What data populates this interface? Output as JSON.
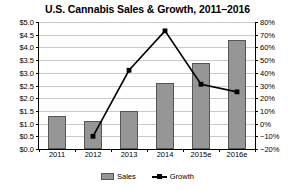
{
  "chart_data": {
    "type": "bar",
    "title": "U.S. Cannabis Sales & Growth, 2011–2016",
    "xlabel": "",
    "ylabel": "",
    "categories": [
      "2011",
      "2012",
      "2013",
      "2014",
      "2015e",
      "2016e"
    ],
    "grid": true,
    "legend_position": "bottom",
    "series": [
      {
        "name": "Sales",
        "type": "bar",
        "axis": "left",
        "unit": "billion USD",
        "values": [
          1.3,
          1.1,
          1.5,
          2.6,
          3.4,
          4.3
        ],
        "color": "#969696"
      },
      {
        "name": "Growth",
        "type": "line",
        "axis": "right",
        "unit": "percent",
        "values": [
          null,
          -10,
          42,
          73,
          31,
          25
        ],
        "color": "#000000"
      }
    ],
    "left_axis": {
      "min": 0.0,
      "max": 5.0,
      "step": 0.5,
      "ticks": [
        "$0.0",
        "$0.5",
        "$1.0",
        "$1.5",
        "$2.0",
        "$2.5",
        "$3.0",
        "$3.5",
        "$4.0",
        "$4.5",
        "$5.0"
      ],
      "tick_values": [
        0.0,
        0.5,
        1.0,
        1.5,
        2.0,
        2.5,
        3.0,
        3.5,
        4.0,
        4.5,
        5.0
      ]
    },
    "right_axis": {
      "min": -20,
      "max": 80,
      "step": 10,
      "ticks": [
        "−20%",
        "−10%",
        "0%",
        "10%",
        "20%",
        "30%",
        "40%",
        "50%",
        "60%",
        "70%",
        "80%"
      ],
      "tick_values": [
        -20,
        -10,
        0,
        10,
        20,
        30,
        40,
        50,
        60,
        70,
        80
      ]
    },
    "legend": [
      {
        "label": "Sales",
        "marker": "bar-swatch"
      },
      {
        "label": "Growth",
        "marker": "line-square-marker"
      }
    ]
  }
}
